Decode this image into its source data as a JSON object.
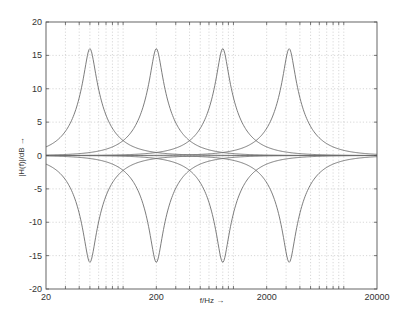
{
  "chart_data": {
    "type": "line",
    "title": "",
    "xlabel": "f/Hz →",
    "ylabel": "|H(f)|/dB →",
    "xscale": "log",
    "xlim": [
      20,
      20000
    ],
    "ylim": [
      -20,
      20
    ],
    "grid": true,
    "legend": null,
    "x_ticks": [
      20,
      200,
      2000,
      20000
    ],
    "x_tick_labels": [
      "20",
      "200",
      "2000",
      "20000"
    ],
    "y_ticks": [
      -20,
      -15,
      -10,
      -5,
      0,
      5,
      10,
      15,
      20
    ],
    "y_tick_labels": [
      "-20",
      "-15",
      "-10",
      "-5",
      "0",
      "5",
      "10",
      "15",
      "20"
    ],
    "gain_db": 16,
    "center_frequencies_hz": [
      50,
      200,
      800,
      3200
    ],
    "series": [
      {
        "name": "boost 50 Hz",
        "fc": 50,
        "gain_db": 16
      },
      {
        "name": "boost 200 Hz",
        "fc": 200,
        "gain_db": 16
      },
      {
        "name": "boost 800 Hz",
        "fc": 800,
        "gain_db": 16
      },
      {
        "name": "boost 3200 Hz",
        "fc": 3200,
        "gain_db": 16
      },
      {
        "name": "cut 50 Hz",
        "fc": 50,
        "gain_db": -16
      },
      {
        "name": "cut 200 Hz",
        "fc": 200,
        "gain_db": -16
      },
      {
        "name": "cut 800 Hz",
        "fc": 800,
        "gain_db": -16
      },
      {
        "name": "cut 3200 Hz",
        "fc": 3200,
        "gain_db": -16
      }
    ],
    "sample_points": {
      "boost": [
        {
          "f": 20,
          "db": 1.2
        },
        {
          "f": 30,
          "db": 3.5
        },
        {
          "f": 40,
          "db": 8.0
        },
        {
          "f": 50,
          "db": 16.0
        },
        {
          "f": 70,
          "db": 7.0
        },
        {
          "f": 100,
          "db": 3.0
        },
        {
          "f": 200,
          "db": 0.8
        }
      ]
    },
    "colors": {
      "curve": "#6e6e6e",
      "grid": "#bdbdbd",
      "frame": "#555555",
      "background": "#ffffff"
    }
  },
  "plot_box": {
    "left": 46,
    "top": 22,
    "right": 377,
    "bottom": 289
  }
}
